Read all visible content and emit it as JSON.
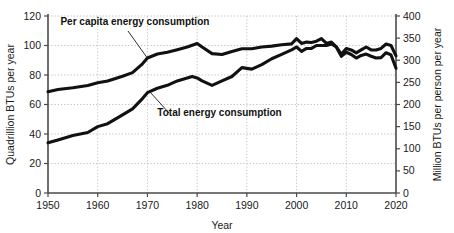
{
  "chart_data": {
    "type": "line",
    "title": "",
    "xlabel": "Year",
    "ylabel": "Quadrillion BTUs per year",
    "ylabel_right": "Million BTUs per person per year",
    "xlim": [
      1950,
      2020
    ],
    "ylim": [
      0,
      120
    ],
    "ylim_right": [
      0,
      400
    ],
    "xticks": [
      1950,
      1960,
      1970,
      1980,
      1990,
      2000,
      2010,
      2020
    ],
    "yticks": [
      0,
      20,
      40,
      60,
      80,
      100,
      120
    ],
    "yticks_right": [
      0,
      50,
      100,
      150,
      200,
      250,
      300,
      350,
      400
    ],
    "grid": true,
    "legend": "annotations",
    "line_color": "#111111",
    "grid_color": "#b9b9b9",
    "axis_color": "#4a4a4a",
    "annotations": [
      {
        "name": "per-capita-annotation",
        "text": "Per capita energy consumption",
        "x": 1952.5,
        "y": 116
      },
      {
        "name": "total-annotation",
        "text": "Total energy consumption",
        "x": 1972.0,
        "y": 54
      }
    ],
    "series": [
      {
        "name": "Per capita energy consumption",
        "axis": "right",
        "unit": "Million BTUs per person per year",
        "x": [
          1950,
          1952,
          1955,
          1958,
          1960,
          1962,
          1965,
          1967,
          1969,
          1970,
          1972,
          1974,
          1976,
          1978,
          1979,
          1980,
          1981,
          1983,
          1985,
          1987,
          1989,
          1991,
          1993,
          1995,
          1997,
          1999,
          2000,
          2001,
          2002,
          2003,
          2004,
          2005,
          2006,
          2007,
          2008,
          2009,
          2010,
          2011,
          2012,
          2013,
          2014,
          2015,
          2016,
          2017,
          2018,
          2019,
          2020
        ],
        "values": [
          229,
          234,
          238,
          243,
          249,
          253,
          264,
          272,
          292,
          305,
          314,
          318,
          324,
          330,
          334,
          338,
          330,
          315,
          313,
          320,
          326,
          326,
          330,
          332,
          335,
          337,
          349,
          338,
          341,
          340,
          343,
          349,
          338,
          341,
          330,
          309,
          318,
          313,
          305,
          311,
          314,
          309,
          305,
          306,
          317,
          312,
          282
        ]
      },
      {
        "name": "Total energy consumption",
        "axis": "left",
        "unit": "Quadrillion BTUs per year",
        "x": [
          1950,
          1952,
          1955,
          1958,
          1960,
          1962,
          1965,
          1967,
          1969,
          1970,
          1972,
          1974,
          1976,
          1978,
          1979,
          1980,
          1981,
          1983,
          1985,
          1987,
          1989,
          1991,
          1993,
          1995,
          1997,
          1999,
          2000,
          2001,
          2002,
          2003,
          2004,
          2005,
          2006,
          2007,
          2008,
          2009,
          2010,
          2011,
          2012,
          2013,
          2014,
          2015,
          2016,
          2017,
          2018,
          2019,
          2020
        ],
        "values": [
          34,
          36,
          39,
          41,
          45,
          47,
          53,
          57,
          64,
          68,
          71,
          73,
          76,
          78,
          79,
          78,
          76,
          73,
          76,
          79,
          85,
          84,
          87,
          91,
          94,
          97,
          99,
          96,
          98,
          98,
          100,
          100,
          100,
          101,
          99,
          94,
          98,
          97,
          95,
          97,
          99,
          97,
          97,
          98,
          101,
          100,
          93
        ]
      }
    ]
  },
  "axes": {
    "left_title": "Quadrillion BTUs per year",
    "right_title": "Million BTUs per person per year",
    "x_title": "Year"
  }
}
